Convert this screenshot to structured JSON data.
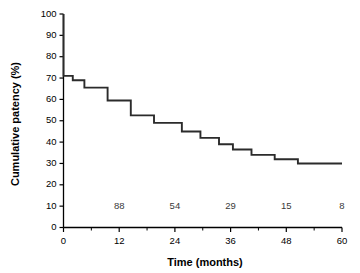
{
  "chart_data": {
    "type": "line",
    "subtype": "kaplan-meier-step",
    "title": "",
    "xlabel": "Time (months)",
    "ylabel": "Cumulative patency (%)",
    "xlim": [
      0,
      60
    ],
    "ylim": [
      0,
      100
    ],
    "grid": false,
    "legend": "none",
    "line_color": "#2b2b2b",
    "xticks": [
      0,
      12,
      24,
      36,
      48,
      60
    ],
    "xtick_labels": [
      "0",
      "12",
      "24",
      "36",
      "48",
      "60"
    ],
    "x_minor_ticks": [
      6,
      18,
      30,
      42,
      54
    ],
    "yticks": [
      0,
      10,
      20,
      30,
      40,
      50,
      60,
      70,
      80,
      90,
      100
    ],
    "ytick_labels": [
      "0",
      "10",
      "20",
      "30",
      "40",
      "50",
      "60",
      "70",
      "80",
      "90",
      "100"
    ],
    "x": [
      0,
      0,
      2,
      2,
      4.5,
      4.5,
      9.5,
      9.5,
      14.5,
      14.5,
      19.5,
      19.5,
      25.5,
      25.5,
      29.5,
      29.5,
      33.5,
      33.5,
      36.5,
      36.5,
      40.5,
      40.5,
      45.5,
      45.5,
      50.5,
      50.5,
      60
    ],
    "y": [
      100,
      71,
      71,
      69,
      69,
      65.5,
      65.5,
      59.5,
      59.5,
      52.5,
      52.5,
      49,
      49,
      45,
      45,
      42,
      42,
      39,
      39,
      36.5,
      36.5,
      34,
      34,
      32,
      32,
      30,
      30
    ],
    "steps": [
      {
        "time": 0,
        "patency": 100
      },
      {
        "time": 0,
        "patency": 71
      },
      {
        "time": 2,
        "patency": 69
      },
      {
        "time": 4.5,
        "patency": 65.5
      },
      {
        "time": 9.5,
        "patency": 59.5
      },
      {
        "time": 14.5,
        "patency": 52.5
      },
      {
        "time": 19.5,
        "patency": 49
      },
      {
        "time": 25.5,
        "patency": 45
      },
      {
        "time": 29.5,
        "patency": 42
      },
      {
        "time": 33.5,
        "patency": 39
      },
      {
        "time": 36.5,
        "patency": 36.5
      },
      {
        "time": 40.5,
        "patency": 34
      },
      {
        "time": 45.5,
        "patency": 32
      },
      {
        "time": 50.5,
        "patency": 30
      },
      {
        "time": 60,
        "patency": 30
      }
    ],
    "at_risk": {
      "row_y_value": 10,
      "times": [
        12,
        24,
        36,
        48,
        60
      ],
      "counts": [
        "88",
        "54",
        "29",
        "15",
        "8"
      ]
    }
  }
}
